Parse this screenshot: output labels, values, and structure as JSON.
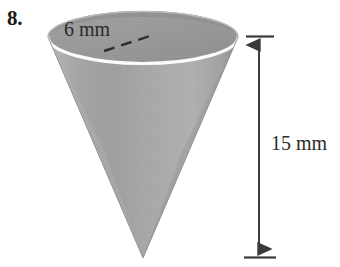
{
  "page": {
    "background_color": "#ffffff",
    "width": 340,
    "height": 267
  },
  "problem": {
    "number_label": "8."
  },
  "figure": {
    "shape_name": "cone",
    "shape_fill_color": "#a8a8a8",
    "shape_shadow_color": "#8f8f8f",
    "rim_highlight_color": "#fdfdfd",
    "opening_fill_color": "#9a9a9a",
    "outline_color": "#7a7a7a",
    "labels": {
      "diameter": "6 mm",
      "height": "15 mm"
    },
    "annotations": {
      "diameter_line_style": "dashed",
      "diameter_line_color": "#2e2e2e",
      "height_line_style": "solid-double-arrow",
      "height_line_color": "#3a3a3a"
    },
    "measurements": [
      {
        "name": "diameter",
        "value": 6,
        "unit": "mm"
      },
      {
        "name": "height",
        "value": 15,
        "unit": "mm"
      }
    ]
  }
}
